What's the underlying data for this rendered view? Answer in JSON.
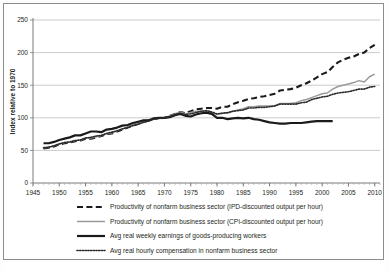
{
  "figure": {
    "background_color": "#ffffff",
    "border_color": "#8c8c8c",
    "bottom_caption_fragment": ""
  },
  "chart_data": {
    "type": "line",
    "title": "",
    "xlabel": "",
    "ylabel": "Index relative to 1970",
    "xlim": [
      1945,
      2011
    ],
    "ylim": [
      0,
      250
    ],
    "ytick_labels": [
      "0",
      "50",
      "100",
      "150",
      "200",
      "250"
    ],
    "yticks": [
      0,
      50,
      100,
      150,
      200,
      250
    ],
    "xtick_labels": [
      "1945",
      "1950",
      "1955",
      "1960",
      "1965",
      "1970",
      "1975",
      "1980",
      "1985",
      "1990",
      "1995",
      "2000",
      "2005",
      "2010"
    ],
    "xticks": [
      1945,
      1950,
      1955,
      1960,
      1965,
      1970,
      1975,
      1980,
      1985,
      1990,
      1995,
      2000,
      2005,
      2010
    ],
    "grid": "horizontal",
    "legend_position": "below-axes",
    "series": [
      {
        "name": "Productivity of nonfarm business sector (IPD-discounted output per hour)",
        "style": "dashed",
        "color": "#1a1a1a",
        "width": 2.1,
        "x": [
          1947,
          1948,
          1949,
          1950,
          1951,
          1952,
          1953,
          1954,
          1955,
          1956,
          1957,
          1958,
          1959,
          1960,
          1961,
          1962,
          1963,
          1964,
          1965,
          1966,
          1967,
          1968,
          1969,
          1970,
          1971,
          1972,
          1973,
          1974,
          1975,
          1976,
          1977,
          1978,
          1979,
          1980,
          1981,
          1982,
          1983,
          1984,
          1985,
          1986,
          1987,
          1988,
          1989,
          1990,
          1991,
          1992,
          1993,
          1994,
          1995,
          1996,
          1997,
          1998,
          1999,
          2000,
          2001,
          2002,
          2003,
          2004,
          2005,
          2006,
          2007,
          2008,
          2009,
          2010
        ],
        "y": [
          53,
          54,
          56,
          59,
          61,
          62,
          64,
          65,
          68,
          68,
          70,
          72,
          75,
          76,
          79,
          82,
          85,
          88,
          91,
          94,
          96,
          99,
          99,
          100,
          103,
          106,
          109,
          107,
          110,
          113,
          114,
          115,
          115,
          114,
          117,
          117,
          121,
          124,
          126,
          129,
          130,
          132,
          133,
          135,
          137,
          142,
          143,
          144,
          146,
          150,
          153,
          157,
          162,
          167,
          170,
          178,
          185,
          189,
          192,
          194,
          198,
          200,
          207,
          212
        ]
      },
      {
        "name": "Productivity of nonfarm business sector (CPI-discounted output per hour)",
        "style": "solid",
        "color": "#9a9a9a",
        "width": 1.5,
        "x": [
          1947,
          1948,
          1949,
          1950,
          1951,
          1952,
          1953,
          1954,
          1955,
          1956,
          1957,
          1958,
          1959,
          1960,
          1961,
          1962,
          1963,
          1964,
          1965,
          1966,
          1967,
          1968,
          1969,
          1970,
          1971,
          1972,
          1973,
          1974,
          1975,
          1976,
          1977,
          1978,
          1979,
          1980,
          1981,
          1982,
          1983,
          1984,
          1985,
          1986,
          1987,
          1988,
          1989,
          1990,
          1991,
          1992,
          1993,
          1994,
          1995,
          1996,
          1997,
          1998,
          1999,
          2000,
          2001,
          2002,
          2003,
          2004,
          2005,
          2006,
          2007,
          2008,
          2009,
          2010
        ],
        "y": [
          54,
          55,
          57,
          60,
          62,
          63,
          65,
          66,
          69,
          69,
          71,
          73,
          76,
          77,
          80,
          83,
          86,
          89,
          92,
          95,
          97,
          100,
          100,
          100,
          103,
          106,
          109,
          106,
          108,
          110,
          110,
          110,
          108,
          105,
          107,
          107,
          110,
          112,
          114,
          117,
          117,
          118,
          118,
          118,
          119,
          122,
          122,
          122,
          123,
          126,
          128,
          131,
          134,
          137,
          138,
          144,
          148,
          150,
          152,
          154,
          157,
          155,
          163,
          167
        ]
      },
      {
        "name": "Avg real weekly earnings of goods-producing workers",
        "style": "solid",
        "color": "#1a1a1a",
        "width": 2.2,
        "x": [
          1947,
          1948,
          1949,
          1950,
          1951,
          1952,
          1953,
          1954,
          1955,
          1956,
          1957,
          1958,
          1959,
          1960,
          1961,
          1962,
          1963,
          1964,
          1965,
          1966,
          1967,
          1968,
          1969,
          1970,
          1971,
          1972,
          1973,
          1974,
          1975,
          1976,
          1977,
          1978,
          1979,
          1980,
          1981,
          1982,
          1983,
          1984,
          1985,
          1986,
          1987,
          1988,
          1989,
          1990,
          1991,
          1992,
          1993,
          1994,
          1995,
          1996,
          1997,
          1998,
          1999,
          2000,
          2001,
          2002
        ],
        "y": [
          61,
          61,
          63,
          66,
          68,
          70,
          73,
          73,
          76,
          79,
          79,
          78,
          82,
          83,
          85,
          88,
          89,
          92,
          94,
          96,
          96,
          99,
          100,
          100,
          101,
          104,
          106,
          103,
          102,
          105,
          107,
          108,
          106,
          100,
          100,
          98,
          99,
          100,
          99,
          100,
          98,
          97,
          95,
          93,
          92,
          91,
          91,
          92,
          92,
          92,
          93,
          94,
          95,
          95,
          95,
          95
        ]
      },
      {
        "name": "Avg real hourly compensation in nonfarm business sector",
        "style": "dotted",
        "color": "#2a2a2a",
        "width": 1.6,
        "x": [
          1947,
          1948,
          1949,
          1950,
          1951,
          1952,
          1953,
          1954,
          1955,
          1956,
          1957,
          1958,
          1959,
          1960,
          1961,
          1962,
          1963,
          1964,
          1965,
          1966,
          1967,
          1968,
          1969,
          1970,
          1971,
          1972,
          1973,
          1974,
          1975,
          1976,
          1977,
          1978,
          1979,
          1980,
          1981,
          1982,
          1983,
          1984,
          1985,
          1986,
          1987,
          1988,
          1989,
          1990,
          1991,
          1992,
          1993,
          1994,
          1995,
          1996,
          1997,
          1998,
          1999,
          2000,
          2001,
          2002,
          2003,
          2004,
          2005,
          2006,
          2007,
          2008,
          2009,
          2010
        ],
        "y": [
          54,
          55,
          57,
          60,
          62,
          63,
          65,
          66,
          69,
          70,
          72,
          73,
          76,
          78,
          80,
          83,
          85,
          88,
          90,
          93,
          95,
          98,
          99,
          100,
          102,
          105,
          107,
          105,
          106,
          108,
          110,
          111,
          109,
          106,
          107,
          108,
          110,
          111,
          112,
          115,
          115,
          116,
          116,
          117,
          118,
          121,
          121,
          121,
          121,
          123,
          124,
          128,
          130,
          132,
          133,
          136,
          138,
          139,
          140,
          142,
          144,
          144,
          147,
          148
        ]
      }
    ]
  },
  "legend": {
    "items": [
      {
        "label": "Productivity of nonfarm business sector (IPD-discounted output per hour)",
        "swatch": "dashed-line-swatch"
      },
      {
        "label": "Productivity of nonfarm business sector (CPI-discounted output per hour)",
        "swatch": "gray-solid-line-swatch"
      },
      {
        "label": "Avg real weekly earnings of goods-producing workers",
        "swatch": "black-solid-line-swatch"
      },
      {
        "label": "Avg real hourly compensation in nonfarm business sector",
        "swatch": "dotted-line-swatch"
      }
    ]
  }
}
